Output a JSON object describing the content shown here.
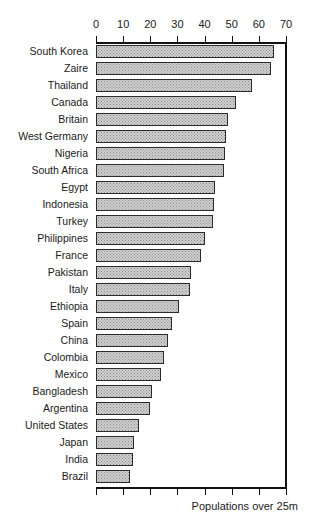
{
  "chart_data": {
    "type": "bar",
    "orientation": "horizontal",
    "title": "",
    "subtitle": "",
    "annotation": "Populations over 25m",
    "xlabel": "",
    "ylabel": "",
    "xlim": [
      0,
      70
    ],
    "xticks": [
      0,
      10,
      20,
      30,
      40,
      50,
      60,
      70
    ],
    "xtick_labels": [
      "0",
      "10",
      "20",
      "30",
      "40",
      "50",
      "60",
      "70"
    ],
    "grid": false,
    "legend": null,
    "axis_top": true,
    "axis_bottom_unlabeled_ticks": true,
    "categories": [
      "South Korea",
      "Zaire",
      "Thailand",
      "Canada",
      "Britain",
      "West Germany",
      "Nigeria",
      "South Africa",
      "Egypt",
      "Indonesia",
      "Turkey",
      "Philippines",
      "France",
      "Pakistan",
      "Italy",
      "Ethiopia",
      "Spain",
      "China",
      "Colombia",
      "Mexico",
      "Bangladesh",
      "Argentina",
      "United States",
      "Japan",
      "India",
      "Brazil"
    ],
    "values": [
      65.5,
      64.5,
      57.5,
      51.5,
      48.5,
      48,
      47.5,
      47,
      44,
      43.5,
      43,
      40,
      38.5,
      35,
      34.5,
      30.5,
      28,
      26.5,
      25,
      24,
      20.5,
      20,
      16,
      14,
      13.5,
      12.5
    ]
  },
  "caption": {
    "text": "Populations over 25m"
  }
}
